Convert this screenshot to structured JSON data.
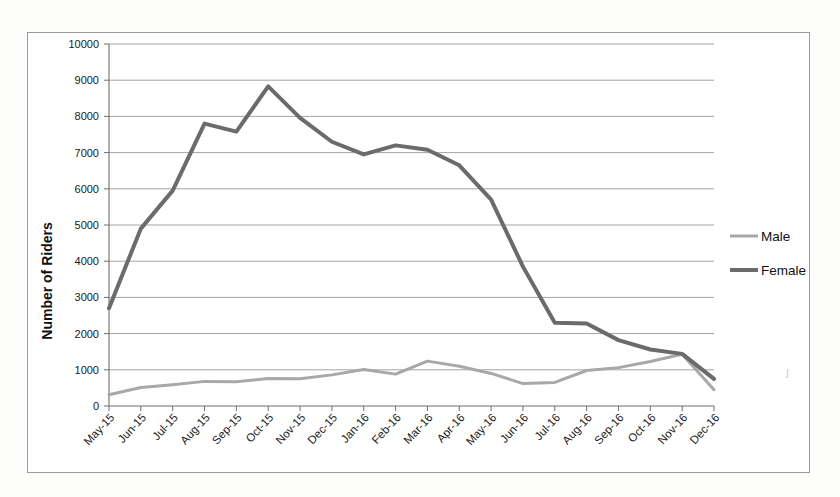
{
  "chart_data": {
    "type": "line",
    "title": "",
    "xlabel": "",
    "ylabel": "Number of Riders",
    "ylim": [
      0,
      10000
    ],
    "y_ticks": [
      0,
      1000,
      2000,
      3000,
      4000,
      5000,
      6000,
      7000,
      8000,
      9000,
      10000
    ],
    "grid": true,
    "legend_position": "right",
    "categories": [
      "May-15",
      "Jun-15",
      "Jul-15",
      "Aug-15",
      "Sep-15",
      "Oct-15",
      "Nov-15",
      "Dec-15",
      "Jan-16",
      "Feb-16",
      "Mar-16",
      "Apr-16",
      "May-16",
      "Jun-16",
      "Jul-16",
      "Aug-16",
      "Sep-16",
      "Oct-16",
      "Nov-16",
      "Dec-16"
    ],
    "series": [
      {
        "name": "Male",
        "color": "#a8a8a8",
        "width": 3,
        "values": [
          310,
          510,
          590,
          680,
          670,
          760,
          750,
          860,
          1010,
          880,
          1240,
          1100,
          900,
          620,
          650,
          980,
          1060,
          1230,
          1430,
          450
        ]
      },
      {
        "name": "Female",
        "color": "#6b6b6b",
        "width": 4,
        "values": [
          2700,
          4900,
          5950,
          7800,
          7580,
          8830,
          7960,
          7300,
          6950,
          7200,
          7080,
          6650,
          5700,
          3850,
          2300,
          2280,
          1820,
          1560,
          1440,
          750
        ]
      }
    ]
  },
  "legend": {
    "items": [
      {
        "label": "Male",
        "color": "#a8a8a8",
        "width": 3
      },
      {
        "label": "Female",
        "color": "#6b6b6b",
        "width": 4
      }
    ]
  },
  "axes": {
    "y_title": "Number of Riders"
  }
}
